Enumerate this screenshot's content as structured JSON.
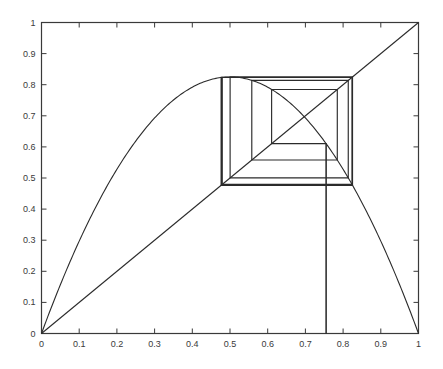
{
  "figure": {
    "title": "",
    "background_color": "#ffffff",
    "line_color": "#2b2b2b",
    "axis_color": "#3a3a3a",
    "label_color": "#3a3a3a"
  },
  "chart_data": {
    "type": "line",
    "title": "",
    "xlabel": "",
    "ylabel": "",
    "xlim": [
      0,
      1
    ],
    "ylim": [
      0,
      1
    ],
    "grid": false,
    "legend_position": "none",
    "xticks": [
      0,
      0.1,
      0.2,
      0.3,
      0.4,
      0.5,
      0.6,
      0.7,
      0.8,
      0.9,
      1
    ],
    "yticks": [
      0,
      0.1,
      0.2,
      0.3,
      0.4,
      0.5,
      0.6,
      0.7,
      0.8,
      0.9,
      1
    ],
    "xtick_labels": [
      "0",
      "0.1",
      "0.2",
      "0.3",
      "0.4",
      "0.5",
      "0.6",
      "0.7",
      "0.8",
      "0.9",
      "1"
    ],
    "ytick_labels": [
      "0",
      "0.1",
      "0.2",
      "0.3",
      "0.4",
      "0.5",
      "0.6",
      "0.7",
      "0.8",
      "0.9",
      "1"
    ],
    "series": [
      {
        "name": "logistic-map-curve",
        "kind": "parabola",
        "equation": "y = r*x*(1-x)",
        "r": 3.3,
        "peak": {
          "x": 0.5,
          "y": 0.825
        },
        "endpoints": [
          {
            "x": 0,
            "y": 0
          },
          {
            "x": 1,
            "y": 0
          }
        ]
      },
      {
        "name": "identity-line",
        "kind": "line",
        "equation": "y = x",
        "endpoints": [
          {
            "x": 0,
            "y": 0
          },
          {
            "x": 1,
            "y": 1
          }
        ]
      },
      {
        "name": "cobweb-orbit",
        "kind": "cobweb",
        "seed_x": 0.755,
        "vertices": [
          {
            "x": 0.755,
            "y": 0.0
          },
          {
            "x": 0.755,
            "y": 0.6104
          },
          {
            "x": 0.6104,
            "y": 0.6104
          },
          {
            "x": 0.6104,
            "y": 0.7846
          },
          {
            "x": 0.7846,
            "y": 0.7846
          },
          {
            "x": 0.7846,
            "y": 0.5578
          },
          {
            "x": 0.5578,
            "y": 0.5578
          },
          {
            "x": 0.5578,
            "y": 0.8137
          },
          {
            "x": 0.8137,
            "y": 0.8137
          },
          {
            "x": 0.8137,
            "y": 0.5003
          },
          {
            "x": 0.5003,
            "y": 0.5003
          },
          {
            "x": 0.5003,
            "y": 0.825
          },
          {
            "x": 0.825,
            "y": 0.825
          },
          {
            "x": 0.825,
            "y": 0.4764
          },
          {
            "x": 0.4764,
            "y": 0.4764
          },
          {
            "x": 0.4764,
            "y": 0.8235
          },
          {
            "x": 0.8235,
            "y": 0.8235
          },
          {
            "x": 0.8235,
            "y": 0.4795
          },
          {
            "x": 0.4795,
            "y": 0.4795
          },
          {
            "x": 0.4795,
            "y": 0.8237
          },
          {
            "x": 0.8237,
            "y": 0.8237
          },
          {
            "x": 0.8237,
            "y": 0.479
          },
          {
            "x": 0.479,
            "y": 0.479
          }
        ],
        "attractor_period": 2,
        "attractor_values": [
          0.4794,
          0.8236
        ]
      }
    ],
    "annotations": [
      {
        "name": "seed-drop-line",
        "kind": "vertical-segment",
        "x": 0.755,
        "y_from": 0.0,
        "y_to": 0.6104
      }
    ]
  }
}
